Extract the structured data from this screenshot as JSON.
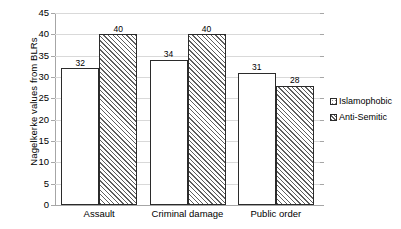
{
  "chart_data": {
    "type": "bar",
    "title": "",
    "subtitle": "",
    "xlabel": "",
    "ylabel": "Nagelkerke values from BLRs",
    "ylim": [
      0,
      45
    ],
    "ytick_step": 5,
    "yticks": [
      0,
      5,
      10,
      15,
      20,
      25,
      30,
      35,
      40,
      45
    ],
    "ytick_labels": [
      "0",
      "5",
      "10",
      "15",
      "20",
      "25",
      "30",
      "35",
      "40",
      "45"
    ],
    "categories": [
      "Assault",
      "Criminal damage",
      "Public order"
    ],
    "series": [
      {
        "name": "Islamophobic",
        "pattern": "dots",
        "values": [
          32,
          34,
          31
        ],
        "value_labels": [
          "32",
          "34",
          "31"
        ]
      },
      {
        "name": "Anti-Semitic",
        "pattern": "diagonal-hatch",
        "values": [
          40,
          40,
          28
        ],
        "value_labels": [
          "40",
          "40",
          "28"
        ]
      }
    ],
    "grid": true,
    "grid_orientation": "horizontal",
    "legend_position": "right",
    "data_labels": true,
    "colors": {
      "bar_outline": "#2b2b2b",
      "bar_fill": "#ffffff",
      "pattern_ink": "#5f5f5f",
      "gridline": "#d9d9d9",
      "axis": "#a6a6a6",
      "text": "#000000",
      "background": "#ffffff"
    }
  }
}
